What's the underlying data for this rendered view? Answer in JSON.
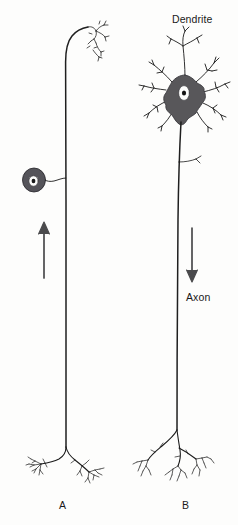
{
  "figure": {
    "background_color": "#fdfdfc",
    "ink_color": "#1a1a1a",
    "soma_fill_color": "#58575a",
    "width": 238,
    "height": 525
  },
  "labels": {
    "dendrite": "Dendrite",
    "axon": "Axon",
    "neuron_a": "A",
    "neuron_b": "B"
  },
  "neurons": [
    {
      "id": "A",
      "label": "A",
      "type": "pseudounipolar-sensory-neuron",
      "soma_shape": "small-round-offset",
      "soma_position": "mid-left, attached by short stalk",
      "nucleus": "white-oval-with-dark-nucleolus",
      "arrow_direction": "up",
      "top_ending": "curved-hook-with-receptor-arborization",
      "bottom_ending": "bifurcated-terminal-arborization",
      "has_dendrite_tree": false
    },
    {
      "id": "B",
      "label": "B",
      "type": "multipolar-motor-neuron",
      "soma_shape": "large-stellate-multipolar",
      "soma_position": "top",
      "nucleus": "white-oval-with-dark-nucleolus",
      "arrow_direction": "down",
      "top_ending": "branching-dendrite-tree",
      "bottom_ending": "branching-terminal-arborization",
      "has_dendrite_tree": true,
      "has_axon_collateral": true
    }
  ]
}
